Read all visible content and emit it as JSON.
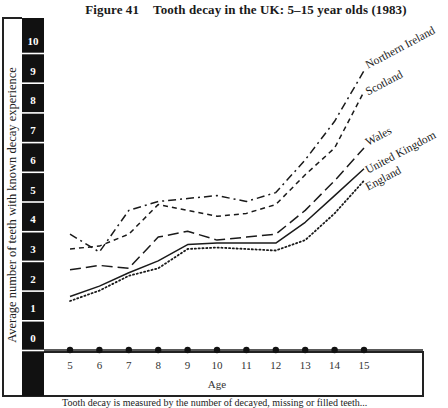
{
  "figure": {
    "number": "Figure 41",
    "title": "Tooth decay in the UK: 5–15 year olds (1983)",
    "caption": "Tooth decay is measured by the number of decayed, missing or filled teeth..."
  },
  "chart_data": {
    "type": "line",
    "title": "Tooth decay in the UK: 5–15 year olds (1983)",
    "xlabel": "Age",
    "ylabel": "Average number of teeth with known decay experience",
    "x": [
      5,
      6,
      7,
      8,
      9,
      10,
      11,
      12,
      13,
      14,
      15
    ],
    "ylim": [
      0,
      10
    ],
    "yticks": [
      0,
      1,
      2,
      3,
      4,
      5,
      6,
      7,
      8,
      9,
      10
    ],
    "grid": false,
    "legend_position": "inline labels at right end of lines",
    "series": [
      {
        "name": "Northern Ireland",
        "style": "dash-dot",
        "values": [
          3.9,
          3.3,
          4.7,
          5.0,
          5.1,
          5.2,
          5.0,
          5.3,
          6.4,
          7.7,
          9.4
        ]
      },
      {
        "name": "Scotland",
        "style": "short-dash",
        "values": [
          3.4,
          3.5,
          3.9,
          4.9,
          4.7,
          4.5,
          4.6,
          4.9,
          5.9,
          6.8,
          8.7
        ]
      },
      {
        "name": "Wales",
        "style": "long-dash",
        "values": [
          2.7,
          2.85,
          2.75,
          3.8,
          4.0,
          3.7,
          3.8,
          3.9,
          4.7,
          5.7,
          6.8
        ]
      },
      {
        "name": "United Kingdom",
        "style": "solid",
        "values": [
          1.8,
          2.15,
          2.6,
          3.0,
          3.55,
          3.6,
          3.6,
          3.6,
          4.3,
          5.2,
          6.1
        ]
      },
      {
        "name": "England",
        "style": "dotted",
        "values": [
          1.65,
          2.0,
          2.5,
          2.75,
          3.4,
          3.45,
          3.4,
          3.35,
          3.7,
          4.6,
          5.7
        ]
      }
    ]
  }
}
